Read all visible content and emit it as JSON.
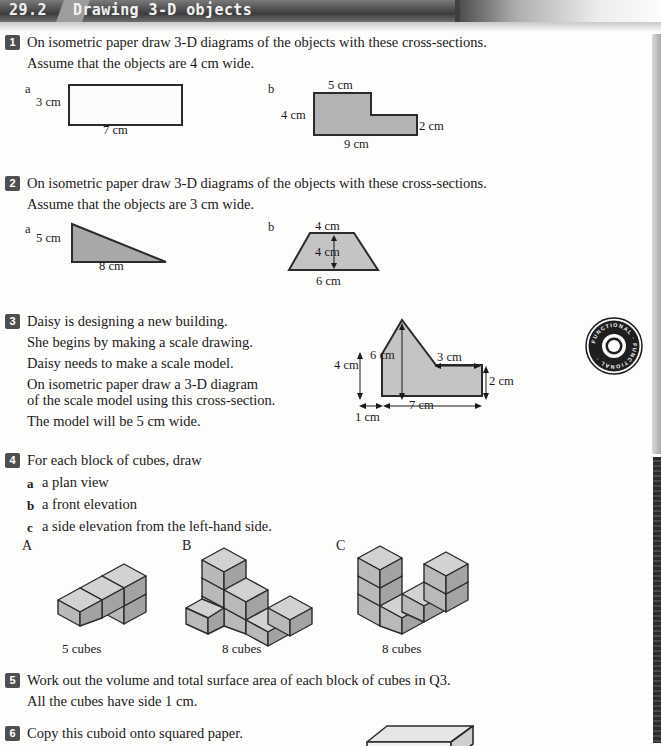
{
  "header": {
    "section_number": "29.2",
    "title": "Drawing 3-D objects"
  },
  "questions": [
    {
      "number": "1",
      "lines": [
        "On isometric paper draw 3-D diagrams of the objects with these cross-sections.",
        "Assume that the objects are 4 cm wide."
      ],
      "parts": [
        {
          "label": "a",
          "shape": "rectangle",
          "fill": "#ffffff",
          "dims": {
            "left": "3 cm",
            "bottom": "7 cm"
          }
        },
        {
          "label": "b",
          "shape": "L-shape",
          "fill": "#b3b3b3",
          "dims": {
            "top": "5 cm",
            "left": "4 cm",
            "right": "2 cm",
            "bottom": "9 cm"
          }
        }
      ]
    },
    {
      "number": "2",
      "lines": [
        "On isometric paper draw 3-D diagrams of the objects with these cross-sections.",
        "Assume that the objects are 3 cm wide."
      ],
      "parts": [
        {
          "label": "a",
          "shape": "right-triangle",
          "fill": "#a8a8a8",
          "dims": {
            "left": "5 cm",
            "bottom": "8 cm"
          }
        },
        {
          "label": "b",
          "shape": "trapezium",
          "fill": "#c4c4c4",
          "dims": {
            "top": "4 cm",
            "height": "4 cm",
            "bottom": "6 cm"
          }
        }
      ]
    },
    {
      "number": "3",
      "lines": [
        "Daisy is designing a new building.",
        "She begins by making a scale drawing.",
        "Daisy needs to make a scale model.",
        "On isometric paper draw a 3-D diagram",
        "of the scale model using this cross-section.",
        "The model will be 5 cm wide."
      ],
      "diagram": {
        "shape": "house-cross-section",
        "fill": "#c4c4c4",
        "dims": {
          "apex_height": "6 cm",
          "wall_height": "4 cm",
          "ledge": "3 cm",
          "right_height": "2 cm",
          "base_main": "7 cm",
          "base_offset": "1 cm"
        }
      }
    },
    {
      "number": "4",
      "lines": [
        "For each block of cubes, draw"
      ],
      "subparts": [
        {
          "label": "a",
          "text": "a plan view"
        },
        {
          "label": "b",
          "text": "a front elevation"
        },
        {
          "label": "c",
          "text": "a side elevation from the left-hand side."
        }
      ],
      "blocks": [
        {
          "letter": "A",
          "caption": "5 cubes"
        },
        {
          "letter": "B",
          "caption": "8 cubes"
        },
        {
          "letter": "C",
          "caption": "8 cubes"
        }
      ]
    },
    {
      "number": "5",
      "lines": [
        "Work out the volume and total surface area of each block of cubes in Q3.",
        "All the cubes have side 1 cm."
      ]
    },
    {
      "number": "6",
      "lines": [
        "Copy this cuboid onto squared paper."
      ]
    }
  ],
  "badge": {
    "ring_text": "FUNCTIONAL · FUNCTIONAL ·",
    "name": "functional-skills-stamp"
  },
  "colors": {
    "banner_dark": "#3c3c3c",
    "badge_grey": "#4f4f4f",
    "shape_grey": "#b3b3b3",
    "cube_top": "#d2d2d2",
    "cube_left": "#b9b9b9",
    "cube_right": "#a3a3a3"
  }
}
